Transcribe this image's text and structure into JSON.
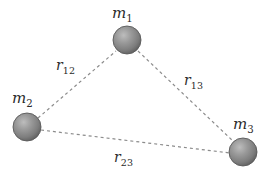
{
  "figure": {
    "type": "physics-diagram",
    "background_color": "#ffffff",
    "width": 275,
    "height": 175
  },
  "style": {
    "sphere_fill_light": "#a8a8a8",
    "sphere_fill_mid": "#8a8a8a",
    "sphere_fill_dark": "#5f5f5f",
    "sphere_stroke": "#5a5a5a",
    "line_color": "#8c8c8c",
    "text_color": "#2b2b2b",
    "dash_pattern": "3 3"
  },
  "bodies": [
    {
      "id": "m1",
      "label_base": "m",
      "label_sub": "1",
      "cx": 127,
      "cy": 40,
      "r": 14,
      "label_x": 112,
      "label_y": 6
    },
    {
      "id": "m2",
      "label_base": "m",
      "label_sub": "2",
      "cx": 27,
      "cy": 127,
      "r": 14,
      "label_x": 12,
      "label_y": 91
    },
    {
      "id": "m3",
      "label_base": "m",
      "label_sub": "3",
      "cx": 243,
      "cy": 152,
      "r": 14,
      "label_x": 233,
      "label_y": 117
    }
  ],
  "distances": [
    {
      "id": "r12",
      "label_base": "r",
      "label_sub": "12",
      "from": "m2",
      "to": "m1",
      "x1": 38,
      "y1": 118,
      "x2": 116,
      "y2": 51,
      "label_x": 56,
      "label_y": 58
    },
    {
      "id": "r13",
      "label_base": "r",
      "label_sub": "13",
      "from": "m1",
      "to": "m3",
      "x1": 138,
      "y1": 51,
      "x2": 234,
      "y2": 142,
      "label_x": 184,
      "label_y": 73
    },
    {
      "id": "r23",
      "label_base": "r",
      "label_sub": "23",
      "from": "m2",
      "to": "m3",
      "x1": 41,
      "y1": 130,
      "x2": 230,
      "y2": 153,
      "label_x": 114,
      "label_y": 150
    }
  ]
}
